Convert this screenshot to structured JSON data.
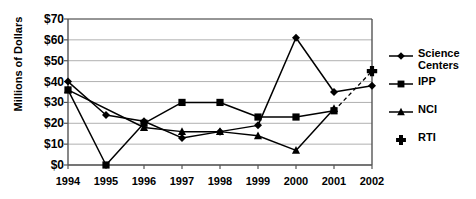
{
  "chart_data": {
    "type": "line",
    "title": "",
    "xlabel": "",
    "ylabel": "Millions of Dollars",
    "categories": [
      "1994",
      "1995",
      "1996",
      "1997",
      "1998",
      "1999",
      "2000",
      "2001",
      "2002"
    ],
    "x": [
      1994,
      1995,
      1996,
      1997,
      1998,
      1999,
      2000,
      2001,
      2002
    ],
    "ylim": [
      0,
      70
    ],
    "ytick_values": [
      0,
      10,
      20,
      30,
      40,
      50,
      60,
      70
    ],
    "ytick_labels": [
      "$0",
      "$10",
      "$20",
      "$30",
      "$40",
      "$50",
      "$60",
      "$70"
    ],
    "grid": true,
    "legend_position": "right",
    "series": [
      {
        "name": "Science Centers",
        "marker": "diamond",
        "line": "solid",
        "color": "#000000",
        "x": [
          1994,
          1995,
          1996,
          1997,
          1998,
          1999,
          2000,
          2001,
          2002
        ],
        "values": [
          40,
          24,
          21,
          13,
          16,
          19,
          61,
          35,
          38
        ]
      },
      {
        "name": "IPP",
        "marker": "square",
        "line": "solid",
        "color": "#000000",
        "x": [
          1994,
          1995,
          1996,
          1997,
          1998,
          1999,
          2000,
          2001
        ],
        "values": [
          36,
          0,
          20,
          30,
          30,
          23,
          23,
          26
        ]
      },
      {
        "name": "NCI",
        "marker": "triangle",
        "line": "solid",
        "color": "#000000",
        "x": [
          1994,
          1996,
          1997,
          1998,
          1999,
          2000,
          2001
        ],
        "values": [
          36,
          18,
          16,
          16,
          14,
          7,
          27
        ]
      },
      {
        "name": "RTI",
        "marker": "cross",
        "line": "dashed",
        "color": "#000000",
        "x": [
          2002
        ],
        "values": [
          45
        ]
      }
    ],
    "annotations": [
      {
        "type": "dashed-connector",
        "from": {
          "x": 2001,
          "y": 26
        },
        "to": {
          "x": 2002,
          "y": 45
        },
        "note": "dashed line linking IPP 2001 point to RTI 2002 marker"
      }
    ]
  },
  "legend": {
    "items": [
      {
        "label": "Science\nCenters",
        "marker": "diamond"
      },
      {
        "label": "IPP",
        "marker": "square"
      },
      {
        "label": "NCI",
        "marker": "triangle"
      },
      {
        "label": "RTI",
        "marker": "cross"
      }
    ]
  }
}
